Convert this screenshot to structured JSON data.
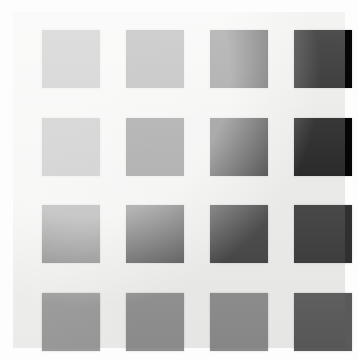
{
  "image": {
    "title": "Grayscale swatch grid",
    "description": "4 by 4 grid of gray squares on an off-white background",
    "background_color": "#fdfdfd",
    "panel_color": "#efefed",
    "rows": 4,
    "columns": 4,
    "swatch_size": 58,
    "col_x": [
      29,
      113,
      197,
      281
    ],
    "row_y": [
      18,
      106,
      193,
      281
    ]
  },
  "swatches": [
    {
      "row": 1,
      "col": 1,
      "name": "swatch-r1c1",
      "color": "#969696",
      "gray_level": 150
    },
    {
      "row": 1,
      "col": 2,
      "name": "swatch-r1c2",
      "color": "#6b6b6b",
      "gray_level": 107
    },
    {
      "row": 1,
      "col": 3,
      "name": "swatch-r1c3",
      "color": "#2b2b2b",
      "gray_level": 43
    },
    {
      "row": 1,
      "col": 4,
      "name": "swatch-r1c4",
      "color": "#060606",
      "gray_level": 6
    },
    {
      "row": 2,
      "col": 1,
      "name": "swatch-r2c1",
      "color": "#979797",
      "gray_level": 151
    },
    {
      "row": 2,
      "col": 2,
      "name": "swatch-r2c2",
      "color": "#3c3c3c",
      "gray_level": 60
    },
    {
      "row": 2,
      "col": 3,
      "name": "swatch-r2c3",
      "color": "#1a1a1a",
      "gray_level": 26
    },
    {
      "row": 2,
      "col": 4,
      "name": "swatch-r2c4",
      "color": "#050505",
      "gray_level": 5
    },
    {
      "row": 3,
      "col": 1,
      "name": "swatch-r3c1",
      "color": "#787878",
      "gray_level": 120
    },
    {
      "row": 3,
      "col": 2,
      "name": "swatch-r3c2",
      "color": "#434343",
      "gray_level": 67
    },
    {
      "row": 3,
      "col": 3,
      "name": "swatch-r3c3",
      "color": "#3a3a3a",
      "gray_level": 58
    },
    {
      "row": 3,
      "col": 4,
      "name": "swatch-r3c4",
      "color": "#303030",
      "gray_level": 48
    },
    {
      "row": 4,
      "col": 1,
      "name": "swatch-r4c1",
      "color": "#9a9a9a",
      "gray_level": 154
    },
    {
      "row": 4,
      "col": 2,
      "name": "swatch-r4c2",
      "color": "#8f8f8f",
      "gray_level": 143
    },
    {
      "row": 4,
      "col": 3,
      "name": "swatch-r4c3",
      "color": "#8b8b8b",
      "gray_level": 139
    },
    {
      "row": 4,
      "col": 4,
      "name": "swatch-r4c4",
      "color": "#5a5a5a",
      "gray_level": 90
    }
  ]
}
